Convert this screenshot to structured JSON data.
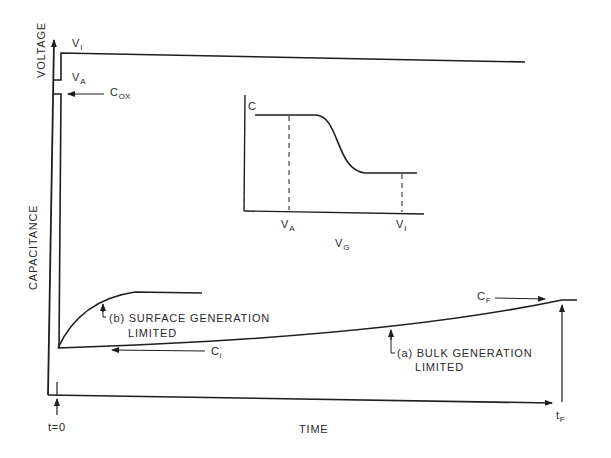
{
  "figure": {
    "y_axis_label_top": "VOLTAGE",
    "y_axis_label_bottom": "CAPACITANCE",
    "x_axis_label": "TIME",
    "t0_label": "t=0",
    "tF_label": "t",
    "tF_sub": "F",
    "voltage_labels": {
      "VI": "V",
      "VI_sub": "I",
      "VA": "V",
      "VA_sub": "A"
    },
    "cox_label": "C",
    "cox_sub": "OX",
    "ci_label": "C",
    "ci_sub": "i",
    "cf_label": "C",
    "cf_sub": "F",
    "curve_b_label_line1": "(b) SURFACE GENERATION",
    "curve_b_label_line2": "LIMITED",
    "curve_a_label_line1": "(a) BULK GENERATION",
    "curve_a_label_line2": "LIMITED"
  },
  "inset": {
    "y_label": "C",
    "x_label": "V",
    "x_sub": "G",
    "tick_VA": "V",
    "tick_VA_sub": "A",
    "tick_VI": "V",
    "tick_VI_sub": "I"
  },
  "colors": {
    "line": "#1e1e1e",
    "text": "#2a2a2a",
    "background": "#ffffff"
  }
}
